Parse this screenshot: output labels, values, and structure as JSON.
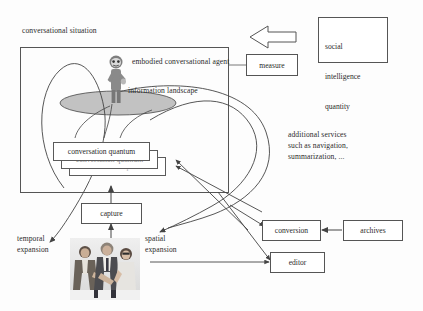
{
  "diagram": {
    "title": "conversational situation",
    "labels": {
      "conversational_situation": "conversational situation",
      "embodied_agent": "embodied conversational agent",
      "information_landscape": "information landscape",
      "temporal_expansion_line1": "temporal",
      "temporal_expansion_line2": "expansion",
      "spatial_expansion_line1": "spatial",
      "spatial_expansion_line2": "expansion",
      "additional_services_line1": "additional services",
      "additional_services_line2": "such as navigation,",
      "additional_services_line3": "summarization, ..."
    },
    "boxes": {
      "conversation_quantum_1": "conversation quantum",
      "conversation_quantum_2": "conversation quantum",
      "conversation_quantum_3": "conversation quantum",
      "capture": "capture",
      "measure": "measure",
      "conversion": "conversion",
      "archives": "archives",
      "editor": "editor"
    },
    "social_box": {
      "line1": "social",
      "line2": "intelligence",
      "line3": "quantity"
    },
    "colors": {
      "stroke": "#555555",
      "text": "#2b2b2b",
      "landscape_fill": "#b9b9b9",
      "agent_body": "#8a8a8a",
      "background": "#ffffff"
    },
    "icons": {
      "block_arrow": "block-arrow-left",
      "agent_figure": "embodied-agent-figure",
      "people_photo": "three-people-conversation-photo"
    }
  }
}
